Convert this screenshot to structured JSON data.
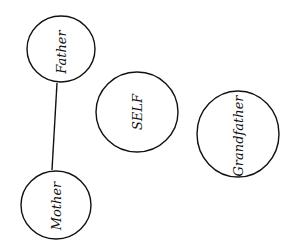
{
  "diagram": {
    "type": "family-relations",
    "nodes": [
      {
        "id": "father",
        "label": "Father"
      },
      {
        "id": "self",
        "label": "SELF"
      },
      {
        "id": "grandfather",
        "label": "Grandfather"
      },
      {
        "id": "mother",
        "label": "Mother"
      }
    ],
    "edges": [
      {
        "from": "father",
        "to": "mother"
      }
    ],
    "colors": {
      "stroke": "#111111",
      "background": "#ffffff"
    }
  }
}
